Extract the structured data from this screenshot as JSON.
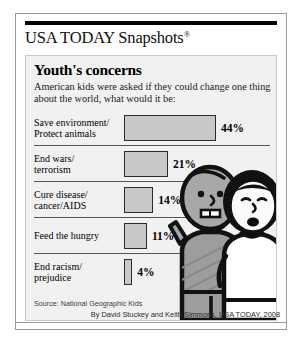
{
  "brand": {
    "name": "USA TODAY Snapshots",
    "registered_mark": "®"
  },
  "chart_data": {
    "type": "bar",
    "title": "Youth's concerns",
    "subtitle": "American kids were asked if they could change one thing about the world, what would it be:",
    "orientation": "horizontal",
    "categories": [
      "Save environment/\nProtect animals",
      "End wars/\nterrorism",
      "Cure disease/\ncancer/AIDS",
      "Feed the hungry",
      "End racism/\nprejudice"
    ],
    "values": [
      44,
      21,
      14,
      11,
      4
    ],
    "value_labels": [
      "44%",
      "21%",
      "14%",
      "11%",
      "4%"
    ],
    "xlabel": "",
    "ylabel": "",
    "xlim": [
      0,
      44
    ],
    "grid": false,
    "legend": false,
    "bar_fill": "#c9c9c9",
    "bar_stroke": "#2a2a2a",
    "rows": [
      {
        "label": "Save environment/\nProtect animals",
        "value": 44,
        "value_label": "44%"
      },
      {
        "label": "End wars/\nterrorism",
        "value": 21,
        "value_label": "21%"
      },
      {
        "label": "Cure disease/\ncancer/AIDS",
        "value": 14,
        "value_label": "14%"
      },
      {
        "label": "Feed the hungry",
        "value": 11,
        "value_label": "11%"
      },
      {
        "label": "End racism/\nprejudice",
        "value": 4,
        "value_label": "4%"
      }
    ]
  },
  "source": "Source: National Geographic Kids",
  "byline": "By David Stuckey and Keith Simmons, USA TODAY, 2008",
  "illustration": {
    "name": "two-children-cartoon",
    "figures": [
      {
        "name": "child-left",
        "skin": "#a8a8a8",
        "shirt": "#9d9d9d",
        "hair": "#1a1a1a"
      },
      {
        "name": "child-right",
        "skin": "#fbfbfb",
        "shirt": "#ffffff",
        "hair": "#111111"
      }
    ]
  },
  "colors": {
    "panel_bg": "#f1f1f1",
    "frame_border": "#9a9a9a",
    "bar_fill": "#c9c9c9",
    "ink": "#000000"
  }
}
